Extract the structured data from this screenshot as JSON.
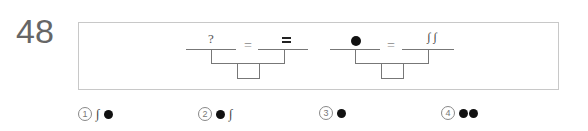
{
  "question": {
    "number": "48"
  },
  "diagrams": [
    {
      "left_symbol": "?",
      "equals": "=",
      "right_symbol": "="
    },
    {
      "left_symbol": "●",
      "equals": "=",
      "right_symbol": "∫ ∫"
    }
  ],
  "choices": [
    {
      "num": "1",
      "content": "∫ ●"
    },
    {
      "num": "2",
      "content": "● ∫"
    },
    {
      "num": "3",
      "content": "●"
    },
    {
      "num": "4",
      "content": "●●"
    }
  ]
}
